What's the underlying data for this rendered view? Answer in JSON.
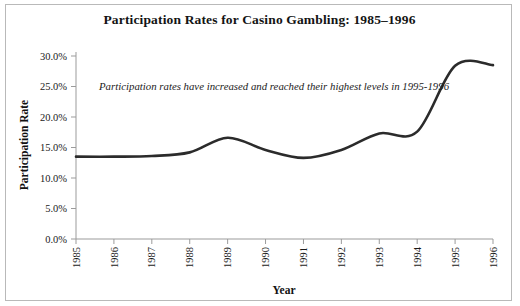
{
  "figure": {
    "title": "Participation Rates for Casino Gambling: 1985–1996",
    "annotation": "Participation rates have increased and reached their highest levels in 1995-1996",
    "border_color": "#b9b9b9",
    "line_color": "#2b2b2b",
    "background": "#ffffff"
  },
  "chart_data": {
    "type": "line",
    "title": "Participation Rates for Casino Gambling: 1985–1996",
    "xlabel": "Year",
    "ylabel": "Participation Rate",
    "categories": [
      "1985",
      "1986",
      "1987",
      "1988",
      "1989",
      "1990",
      "1991",
      "1992",
      "1993",
      "1994",
      "1995",
      "1996"
    ],
    "x": [
      1985,
      1986,
      1987,
      1988,
      1989,
      1990,
      1991,
      1992,
      1993,
      1994,
      1995,
      1996
    ],
    "values": [
      13.5,
      13.5,
      13.6,
      14.2,
      16.6,
      14.6,
      13.3,
      14.6,
      17.3,
      17.6,
      28.4,
      28.5
    ],
    "ylim": [
      0,
      30
    ],
    "yticks": [
      0,
      5,
      10,
      15,
      20,
      25,
      30
    ],
    "ytick_labels": [
      "0.0%",
      "5.0%",
      "10.0%",
      "15.0%",
      "20.0%",
      "25.0%",
      "30.0%"
    ],
    "xtick_labels": [
      "1985",
      "1986",
      "1987",
      "1988",
      "1989",
      "1990",
      "1991",
      "1992",
      "1993",
      "1994",
      "1995",
      "1996"
    ],
    "grid": false,
    "legend": null,
    "annotations": [
      {
        "text": "Participation rates have increased and reached their highest levels in 1995-1996",
        "x": 1986.0,
        "y": 26.0
      }
    ],
    "series": [
      {
        "name": "Participation Rate",
        "values": [
          13.5,
          13.5,
          13.6,
          14.2,
          16.6,
          14.6,
          13.3,
          14.6,
          17.3,
          17.6,
          28.4,
          28.5
        ]
      }
    ]
  }
}
